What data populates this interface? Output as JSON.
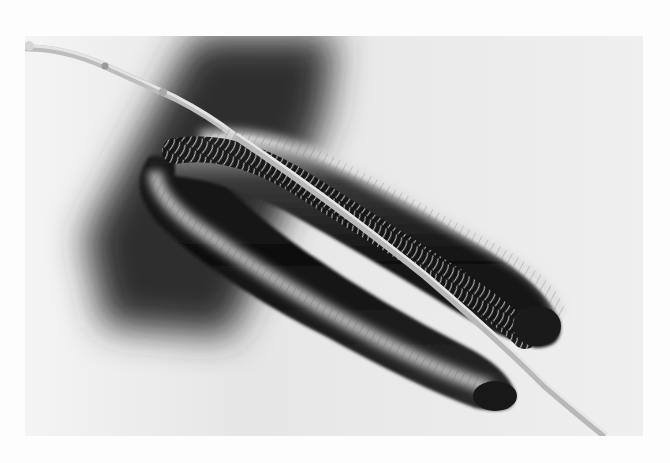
{
  "image": {
    "subject": "millipede coiled on a twig",
    "style": "black-and-white photograph",
    "alt": "Black-and-white photograph of a millipede curled over a thin twig, legs gripping the branch, against a pale background with a dark blurred shadow band",
    "colors": {
      "page": "#fdfdfd",
      "background_light": "#ececec",
      "shadow": "#2a2a2a",
      "body_dark": "#151515",
      "body_highlight": "#d8d8d8",
      "twig": "#cfcfcf"
    },
    "frame": {
      "left": 25,
      "top": 36,
      "width": 618,
      "height": 400
    }
  }
}
